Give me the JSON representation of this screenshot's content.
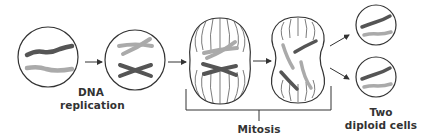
{
  "diagram": {
    "colors": {
      "outline": "#333333",
      "chromosome_dark": "#555555",
      "chromosome_light": "#aaaaaa",
      "text": "#333333",
      "background": "#ffffff"
    },
    "stages": [
      {
        "id": "parent-cell",
        "description": "Cell with one dark and one light chromosome"
      },
      {
        "id": "replicated-cell",
        "description": "Cell with duplicated X-shaped chromosomes"
      },
      {
        "id": "metaphase-cell",
        "description": "Elongated cell with spindle fibers, chromosomes aligned"
      },
      {
        "id": "anaphase-cell",
        "description": "Pinching cell with chromatids separating"
      },
      {
        "id": "daughter-cell-top",
        "description": "Daughter cell with one dark and one light chromosome"
      },
      {
        "id": "daughter-cell-bottom",
        "description": "Daughter cell with one dark and one light chromosome"
      }
    ],
    "labels": {
      "dna_replication_line1": "DNA",
      "dna_replication_line2": "replication",
      "mitosis": "Mitosis",
      "two_diploid_line1": "Two",
      "two_diploid_line2": "diploid cells"
    }
  }
}
